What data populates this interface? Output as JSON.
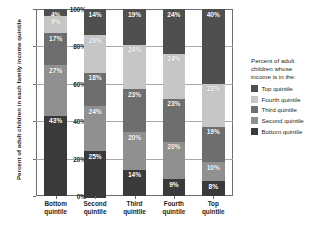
{
  "chart_data": {
    "type": "bar",
    "subtype": "100% stacked bar",
    "title": "",
    "xlabel": "",
    "ylabel": "Percent of adult children in each family income quintile",
    "ylim": [
      0,
      100
    ],
    "ytick_labels": [
      "0%",
      "20%",
      "40%",
      "60%",
      "80%",
      "100%"
    ],
    "ytick_values": [
      0,
      20,
      40,
      60,
      80,
      100
    ],
    "grid": true,
    "legend_position": "right",
    "legend_title": "Percent of adult children whose income is in the:",
    "categories": [
      "Bottom quintile",
      "Second quintile",
      "Third quintile",
      "Fourth quintile",
      "Top quintile"
    ],
    "series": [
      {
        "name": "Top quintile",
        "color": "#4f4f4f",
        "values": [
          4,
          14,
          19,
          24,
          40
        ],
        "labels": [
          "4%",
          "14%",
          "19%",
          "24%",
          "40%"
        ]
      },
      {
        "name": "Fourth quintile",
        "color": "#c6c6c6",
        "values": [
          9,
          20,
          24,
          24,
          23
        ],
        "labels": [
          "9%",
          "20%",
          "24%",
          "24%",
          "23%"
        ]
      },
      {
        "name": "Third quintile",
        "color": "#6e6e6e",
        "values": [
          17,
          18,
          23,
          23,
          19
        ],
        "labels": [
          "17%",
          "18%",
          "23%",
          "23%",
          "19%"
        ]
      },
      {
        "name": "Second quintile",
        "color": "#909090",
        "values": [
          27,
          24,
          20,
          20,
          10
        ],
        "labels": [
          "27%",
          "24%",
          "20%",
          "20%",
          "10%"
        ]
      },
      {
        "name": "Bottom quintile",
        "color": "#3a3a3a",
        "values": [
          43,
          25,
          14,
          9,
          8
        ],
        "labels": [
          "43%",
          "25%",
          "14%",
          "9%",
          "8%"
        ]
      }
    ]
  },
  "axes": {
    "y_title": "Percent of adult children in each family income quintile",
    "y_ticks": [
      {
        "label": "100%",
        "value": 100
      },
      {
        "label": "80%",
        "value": 80
      },
      {
        "label": "60%",
        "value": 60
      },
      {
        "label": "40%",
        "value": 40
      },
      {
        "label": "20%",
        "value": 20
      },
      {
        "label": "0%",
        "value": 0
      }
    ],
    "x_ticks": [
      {
        "line1": "Bottom",
        "line2": "quintile"
      },
      {
        "line1": "Second",
        "line2": "quintile"
      },
      {
        "line1": "Third",
        "line2": "quintile"
      },
      {
        "line1": "Fourth",
        "line2": "quintile"
      },
      {
        "line1": "Top",
        "line2": "quintile"
      }
    ]
  },
  "legend": {
    "title_line1": "Percent of adult",
    "title_line2": "children whose",
    "title_line3": "income is in the:",
    "items": [
      {
        "label": "Top quintile",
        "color": "#4f4f4f"
      },
      {
        "label": "Fourth quintile",
        "color": "#c6c6c6"
      },
      {
        "label": "Third quintile",
        "color": "#6e6e6e"
      },
      {
        "label": "Second quintile",
        "color": "#909090"
      },
      {
        "label": "Bottom quintile",
        "color": "#3a3a3a"
      }
    ]
  },
  "colors": {
    "axis": "#6d6e71",
    "gridline": "#a7a9ac",
    "text": "#231f20",
    "label_text": "#ffffff",
    "background": "#ffffff"
  }
}
